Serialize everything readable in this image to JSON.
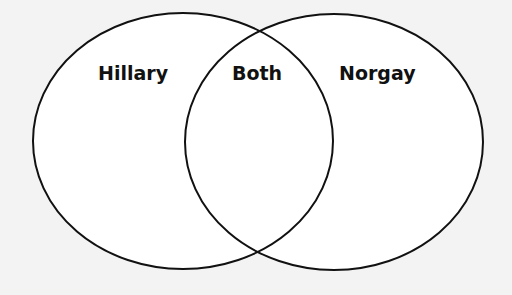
{
  "diagram": {
    "type": "venn",
    "sets": [
      {
        "label": "Hillary"
      },
      {
        "label": "Norgay"
      }
    ],
    "intersection": {
      "label": "Both"
    },
    "colors": {
      "background": "#f3f3f3",
      "fill": "#ffffff",
      "stroke": "#111111",
      "text": "#111111"
    }
  }
}
